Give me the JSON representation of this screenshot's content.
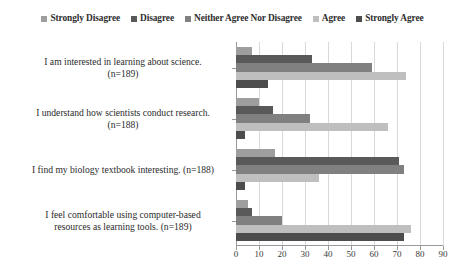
{
  "chart_data": {
    "type": "bar",
    "orientation": "horizontal",
    "title": "",
    "xlabel": "",
    "ylabel": "",
    "xlim": [
      0,
      90
    ],
    "xticks": [
      0,
      10,
      20,
      30,
      40,
      50,
      60,
      70,
      80,
      90
    ],
    "grid": true,
    "legend_position": "top",
    "categories": [
      "I am interested in learning about science. (n=189)",
      "I understand how scientists conduct research. (n=188)",
      "I find my biology textbook interesting. (n=188)",
      "I feel comfortable using computer-based resources as learning tools. (n=189)"
    ],
    "category_lines": [
      [
        "I am interested in learning about science.",
        "(n=189)"
      ],
      [
        "I understand how scientists conduct research.",
        "(n=188)"
      ],
      [
        "I find my biology textbook interesting. (n=188)"
      ],
      [
        "I feel comfortable using computer-based",
        "resources as learning tools. (n=189)"
      ]
    ],
    "series": [
      {
        "name": "Strongly Disagree",
        "color": "#9e9e9e",
        "values": [
          7,
          10,
          17,
          5
        ]
      },
      {
        "name": "Disagree",
        "color": "#595959",
        "values": [
          33,
          16,
          71,
          7
        ]
      },
      {
        "name": "Neither Agree Nor Disagree",
        "color": "#808080",
        "values": [
          59,
          32,
          73,
          20
        ]
      },
      {
        "name": "Agree",
        "color": "#bfbfbf",
        "values": [
          74,
          66,
          36,
          76
        ]
      },
      {
        "name": "Strongly Agree",
        "color": "#4d4d4d",
        "values": [
          14,
          4,
          4,
          73
        ]
      }
    ]
  }
}
